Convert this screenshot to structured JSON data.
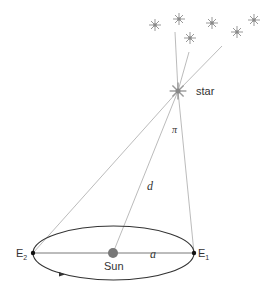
{
  "diagram": {
    "labels": {
      "star": "star",
      "parallax": "π",
      "distance": "d",
      "semi_major_axis": "a",
      "sun": "Sun",
      "e1": "E",
      "e1_sub": "1",
      "e2": "E",
      "e2_sub": "2"
    },
    "colors": {
      "lines": "#aaaaaa",
      "orbit": "#333333",
      "sun": "#777777",
      "stars": "#888888",
      "text": "#333333"
    },
    "background_stars": [
      {
        "x": 155,
        "y": 25
      },
      {
        "x": 179,
        "y": 19
      },
      {
        "x": 190,
        "y": 38
      },
      {
        "x": 212,
        "y": 23
      },
      {
        "x": 237,
        "y": 32
      },
      {
        "x": 254,
        "y": 20
      }
    ],
    "main_star": {
      "x": 178,
      "y": 91
    },
    "orbit": {
      "cx": 113,
      "cy": 253,
      "rx": 80,
      "ry": 27
    },
    "points": {
      "E1": {
        "x": 194,
        "y": 253
      },
      "E2": {
        "x": 33,
        "y": 253
      },
      "Sun": {
        "x": 113,
        "y": 253
      }
    }
  }
}
